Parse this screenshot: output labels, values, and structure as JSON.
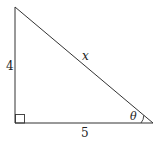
{
  "diagram": {
    "type": "right-triangle",
    "labels": {
      "vertical_leg": "4",
      "horizontal_leg": "5",
      "hypotenuse": "x",
      "angle": "θ"
    },
    "angle_position": "bottom-right vertex",
    "right_angle_position": "bottom-left vertex",
    "stroke_color": "#333333",
    "background_color": "#ffffff"
  }
}
